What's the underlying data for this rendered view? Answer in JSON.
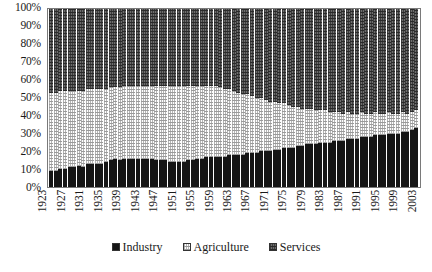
{
  "chart_data": {
    "type": "bar",
    "subtype": "100% stacked column",
    "title": "",
    "subtitle": "",
    "xlabel": "",
    "ylabel": "",
    "ylim": [
      0,
      100
    ],
    "yticks": [
      "0%",
      "10%",
      "20%",
      "30%",
      "40%",
      "50%",
      "60%",
      "70%",
      "80%",
      "90%",
      "100%"
    ],
    "ytick_values": [
      0,
      10,
      20,
      30,
      40,
      50,
      60,
      70,
      80,
      90,
      100
    ],
    "grid": false,
    "legend_position": "bottom",
    "x_tick_step": 4,
    "xtick_labels": [
      "1923",
      "1927",
      "1931",
      "1935",
      "1939",
      "1943",
      "1947",
      "1951",
      "1955",
      "1959",
      "1963",
      "1967",
      "1971",
      "1975",
      "1979",
      "1983",
      "1987",
      "1991",
      "1995",
      "1999",
      "2003"
    ],
    "x": [
      1923,
      1924,
      1925,
      1926,
      1927,
      1928,
      1929,
      1930,
      1931,
      1932,
      1933,
      1934,
      1935,
      1936,
      1937,
      1938,
      1939,
      1940,
      1941,
      1942,
      1943,
      1944,
      1945,
      1946,
      1947,
      1948,
      1949,
      1950,
      1951,
      1952,
      1953,
      1954,
      1955,
      1956,
      1957,
      1958,
      1959,
      1960,
      1961,
      1962,
      1963,
      1964,
      1965,
      1966,
      1967,
      1968,
      1969,
      1970,
      1971,
      1972,
      1973,
      1974,
      1975,
      1976,
      1977,
      1978,
      1979,
      1980,
      1981,
      1982,
      1983,
      1984,
      1985,
      1986,
      1987,
      1988,
      1989,
      1990,
      1991,
      1992,
      1993,
      1994,
      1995,
      1996,
      1997,
      1998,
      1999,
      2000,
      2001,
      2002,
      2003
    ],
    "series": [
      {
        "name": "Industry",
        "pattern": "solid-black",
        "color": "#151515",
        "values": [
          9,
          9,
          10,
          10,
          11,
          11,
          12,
          11,
          13,
          13,
          13,
          13,
          14,
          15,
          16,
          15,
          16,
          16,
          16,
          16,
          16,
          16,
          16,
          15,
          15,
          15,
          14,
          14,
          14,
          14,
          15,
          15,
          16,
          16,
          17,
          17,
          17,
          17,
          17,
          18,
          18,
          18,
          18,
          19,
          19,
          19,
          20,
          20,
          20,
          21,
          21,
          22,
          22,
          22,
          23,
          23,
          24,
          24,
          24,
          25,
          25,
          25,
          26,
          26,
          26,
          27,
          27,
          27,
          28,
          28,
          28,
          29,
          29,
          29,
          30,
          30,
          30,
          31,
          31,
          32,
          33
        ]
      },
      {
        "name": "Agriculture",
        "pattern": "light-dotted",
        "color": "#fdfdfd",
        "values": [
          44,
          44,
          44,
          44,
          43,
          43,
          42,
          43,
          42,
          42,
          42,
          42,
          41,
          41,
          40,
          41,
          41,
          41,
          41,
          41,
          41,
          41,
          41,
          42,
          42,
          42,
          43,
          43,
          43,
          43,
          42,
          42,
          41,
          41,
          40,
          40,
          40,
          39,
          38,
          37,
          36,
          35,
          34,
          33,
          32,
          31,
          30,
          29,
          28,
          27,
          26,
          25,
          24,
          23,
          22,
          21,
          20,
          20,
          19,
          18,
          18,
          17,
          16,
          16,
          15,
          15,
          14,
          14,
          14,
          13,
          13,
          13,
          12,
          12,
          12,
          11,
          11,
          11,
          10,
          10,
          10
        ]
      },
      {
        "name": "Services",
        "pattern": "dark-hatched",
        "color": "#6d6d6d",
        "values": [
          47,
          47,
          46,
          46,
          46,
          46,
          46,
          46,
          45,
          45,
          45,
          45,
          45,
          44,
          44,
          44,
          43,
          43,
          43,
          43,
          43,
          43,
          43,
          43,
          43,
          43,
          43,
          43,
          43,
          43,
          43,
          43,
          43,
          43,
          43,
          43,
          43,
          44,
          45,
          45,
          46,
          47,
          48,
          48,
          49,
          50,
          50,
          51,
          52,
          52,
          53,
          53,
          54,
          55,
          55,
          56,
          56,
          56,
          57,
          57,
          57,
          58,
          58,
          58,
          59,
          58,
          59,
          59,
          58,
          59,
          59,
          58,
          59,
          59,
          58,
          59,
          59,
          58,
          59,
          58,
          57
        ]
      }
    ]
  },
  "legend": {
    "items": [
      {
        "label": "Industry",
        "swatch": "industry-swatch"
      },
      {
        "label": "Agriculture",
        "swatch": "agriculture-swatch"
      },
      {
        "label": "Services",
        "swatch": "services-swatch"
      }
    ]
  }
}
